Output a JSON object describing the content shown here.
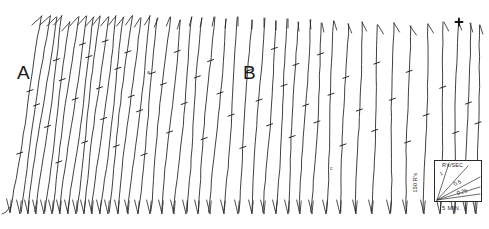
{
  "figure": {
    "caption_title": "Cumulative Record",
    "background_color": "#ffffff",
    "ink_color": "#1f1f1f",
    "width_px": 489,
    "height_px": 229
  },
  "section_labels": [
    {
      "text": "A",
      "x": 17,
      "y": 63
    },
    {
      "text": "B",
      "x": 243,
      "y": 63
    }
  ],
  "micro_labels": [
    {
      "text": "a",
      "x": 147,
      "y": 70
    },
    {
      "text": "c",
      "x": 330,
      "y": 166
    }
  ],
  "legend": {
    "rate_axis_label": "R's/SEC",
    "y_axis_label": "150 R's",
    "x_axis_label": "5 MIN.",
    "slope_labels": [
      "1",
      "0.5",
      "0.25"
    ],
    "slope_values": [
      1,
      0.5,
      0.25
    ],
    "box": {
      "x": 18,
      "y": 2,
      "w": 48,
      "h": 42
    }
  },
  "markers": {
    "event_cross": {
      "x": 459,
      "y": 22,
      "size": 7,
      "description": "bold cross event marker"
    }
  },
  "chart_data": {
    "type": "line",
    "xlabel": "5 MIN.",
    "ylabel": "150 R's",
    "grid": false,
    "legend_position": "bottom-right",
    "axis_calibration": {
      "vertical_full_scale_responses": 150,
      "horizontal_tick_minutes": 5,
      "slope_reference_rates": [
        1,
        0.5,
        0.25
      ]
    },
    "segments": [
      {
        "name": "A",
        "label_x": 17,
        "label_y": 63,
        "stroke_count": 23,
        "mean_slope_deg": 72,
        "note": "steep, high-rate responding"
      },
      {
        "name": "B",
        "label_x": 243,
        "label_y": 63,
        "stroke_count": 21,
        "mean_slope_deg": 78,
        "note": "progressively steeper, lower rate at right"
      }
    ],
    "strokes": [
      {
        "x_bottom": 10,
        "x_top": 42,
        "y_bottom": 211,
        "y_top": 16,
        "ticks": [
          0.3,
          0.62
        ]
      },
      {
        "x_bottom": 20,
        "x_top": 50,
        "y_bottom": 212,
        "y_top": 16,
        "ticks": [
          0.55
        ]
      },
      {
        "x_bottom": 28,
        "x_top": 56,
        "y_bottom": 212,
        "y_top": 17,
        "ticks": []
      },
      {
        "x_bottom": 36,
        "x_top": 62,
        "y_bottom": 212,
        "y_top": 16,
        "ticks": [
          0.44,
          0.78
        ]
      },
      {
        "x_bottom": 44,
        "x_top": 70,
        "y_bottom": 212,
        "y_top": 22,
        "ticks": [
          0.7
        ]
      },
      {
        "x_bottom": 52,
        "x_top": 78,
        "y_bottom": 212,
        "y_top": 17,
        "ticks": [
          0.26
        ]
      },
      {
        "x_bottom": 60,
        "x_top": 86,
        "y_bottom": 212,
        "y_top": 16,
        "ticks": [
          0.58,
          0.86
        ]
      },
      {
        "x_bottom": 68,
        "x_top": 94,
        "y_bottom": 212,
        "y_top": 17,
        "ticks": [
          0.8
        ]
      },
      {
        "x_bottom": 76,
        "x_top": 100,
        "y_bottom": 212,
        "y_top": 16,
        "ticks": [
          0.36
        ]
      },
      {
        "x_bottom": 84,
        "x_top": 108,
        "y_bottom": 212,
        "y_top": 17,
        "ticks": [
          0.64,
          0.88
        ]
      },
      {
        "x_bottom": 92,
        "x_top": 116,
        "y_bottom": 212,
        "y_top": 16,
        "ticks": [
          0.48
        ]
      },
      {
        "x_bottom": 100,
        "x_top": 124,
        "y_bottom": 212,
        "y_top": 17,
        "ticks": [
          0.74
        ]
      },
      {
        "x_bottom": 108,
        "x_top": 132,
        "y_bottom": 212,
        "y_top": 16,
        "ticks": [
          0.34,
          0.82
        ]
      },
      {
        "x_bottom": 118,
        "x_top": 140,
        "y_bottom": 212,
        "y_top": 18,
        "ticks": [
          0.6
        ]
      },
      {
        "x_bottom": 128,
        "x_top": 150,
        "y_bottom": 212,
        "y_top": 16,
        "ticks": [
          0.52
        ]
      },
      {
        "x_bottom": 138,
        "x_top": 158,
        "y_bottom": 212,
        "y_top": 18,
        "ticks": [
          0.3,
          0.72
        ]
      },
      {
        "x_bottom": 150,
        "x_top": 170,
        "y_bottom": 212,
        "y_top": 17,
        "ticks": [
          0.66
        ]
      },
      {
        "x_bottom": 162,
        "x_top": 180,
        "y_bottom": 212,
        "y_top": 20,
        "ticks": [
          0.42,
          0.84
        ]
      },
      {
        "x_bottom": 174,
        "x_top": 192,
        "y_bottom": 212,
        "y_top": 17,
        "ticks": [
          0.56
        ]
      },
      {
        "x_bottom": 186,
        "x_top": 202,
        "y_bottom": 212,
        "y_top": 18,
        "ticks": [
          0.7
        ]
      },
      {
        "x_bottom": 198,
        "x_top": 214,
        "y_bottom": 212,
        "y_top": 17,
        "ticks": [
          0.38,
          0.78
        ]
      },
      {
        "x_bottom": 210,
        "x_top": 226,
        "y_bottom": 212,
        "y_top": 19,
        "ticks": [
          0.62
        ]
      },
      {
        "x_bottom": 224,
        "x_top": 238,
        "y_bottom": 212,
        "y_top": 17,
        "ticks": [
          0.5
        ]
      },
      {
        "x_bottom": 238,
        "x_top": 252,
        "y_bottom": 212,
        "y_top": 20,
        "ticks": [
          0.34,
          0.74
        ]
      },
      {
        "x_bottom": 252,
        "x_top": 264,
        "y_bottom": 212,
        "y_top": 18,
        "ticks": [
          0.58
        ]
      },
      {
        "x_bottom": 264,
        "x_top": 276,
        "y_bottom": 212,
        "y_top": 21,
        "ticks": [
          0.46,
          0.86
        ]
      },
      {
        "x_bottom": 276,
        "x_top": 288,
        "y_bottom": 212,
        "y_top": 19,
        "ticks": [
          0.66
        ]
      },
      {
        "x_bottom": 288,
        "x_top": 298,
        "y_bottom": 212,
        "y_top": 22,
        "ticks": [
          0.4,
          0.78
        ]
      },
      {
        "x_bottom": 300,
        "x_top": 310,
        "y_bottom": 212,
        "y_top": 20,
        "ticks": [
          0.56
        ]
      },
      {
        "x_bottom": 312,
        "x_top": 322,
        "y_bottom": 212,
        "y_top": 23,
        "ticks": [
          0.48,
          0.84
        ]
      },
      {
        "x_bottom": 326,
        "x_top": 334,
        "y_bottom": 212,
        "y_top": 21,
        "ticks": [
          0.62
        ]
      },
      {
        "x_bottom": 340,
        "x_top": 348,
        "y_bottom": 212,
        "y_top": 24,
        "ticks": [
          0.36,
          0.72
        ]
      },
      {
        "x_bottom": 356,
        "x_top": 362,
        "y_bottom": 212,
        "y_top": 22,
        "ticks": [
          0.54
        ]
      },
      {
        "x_bottom": 372,
        "x_top": 378,
        "y_bottom": 212,
        "y_top": 25,
        "ticks": [
          0.44,
          0.8
        ]
      },
      {
        "x_bottom": 390,
        "x_top": 394,
        "y_bottom": 212,
        "y_top": 23,
        "ticks": [
          0.6
        ]
      },
      {
        "x_bottom": 406,
        "x_top": 410,
        "y_bottom": 212,
        "y_top": 26,
        "ticks": [
          0.38,
          0.76
        ]
      },
      {
        "x_bottom": 424,
        "x_top": 428,
        "y_bottom": 212,
        "y_top": 24,
        "ticks": [
          0.52
        ]
      },
      {
        "x_bottom": 440,
        "x_top": 444,
        "y_bottom": 212,
        "y_top": 22,
        "ticks": [
          0.66
        ]
      },
      {
        "x_bottom": 454,
        "x_top": 458,
        "y_bottom": 212,
        "y_top": 21,
        "ticks": [
          0.42
        ]
      },
      {
        "x_bottom": 466,
        "x_top": 470,
        "y_bottom": 212,
        "y_top": 23,
        "ticks": [
          0.58
        ]
      },
      {
        "x_bottom": 476,
        "x_top": 480,
        "y_bottom": 212,
        "y_top": 25,
        "ticks": [
          0.48
        ]
      }
    ]
  }
}
